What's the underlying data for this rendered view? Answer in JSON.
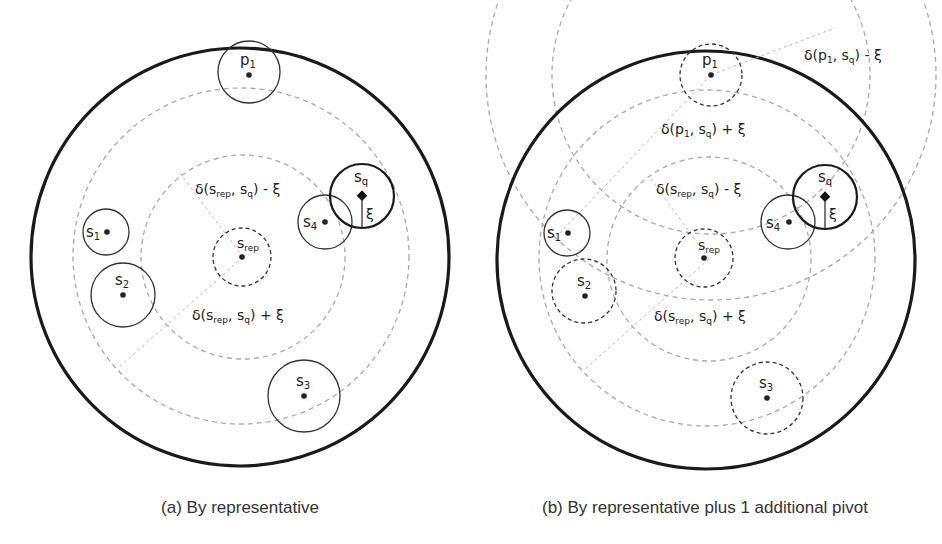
{
  "panels": [
    {
      "id": "a",
      "caption": "(a) By representative",
      "labels": {
        "p1": "p",
        "p1_sub": "1",
        "s1": "s",
        "s1_sub": "1",
        "s2": "s",
        "s2_sub": "2",
        "s3": "s",
        "s3_sub": "3",
        "s4": "s",
        "s4_sub": "4",
        "sq": "s",
        "sq_sub": "q",
        "srep": "s",
        "srep_sub": "rep",
        "xi": "ξ",
        "inner_bound": "δ(s",
        "inner_bound_sub": "rep",
        "inner_bound_rest": ", s",
        "inner_bound_sub2": "q",
        "inner_bound_tail": ") - ξ",
        "outer_bound": "δ(s",
        "outer_bound_sub": "rep",
        "outer_bound_rest": ", s",
        "outer_bound_sub2": "q",
        "outer_bound_tail": ") + ξ"
      }
    },
    {
      "id": "b",
      "caption": "(b) By representative plus 1 additional pivot",
      "labels": {
        "p1": "p",
        "p1_sub": "1",
        "s1": "s",
        "s1_sub": "1",
        "s2": "s",
        "s2_sub": "2",
        "s3": "s",
        "s3_sub": "3",
        "s4": "s",
        "s4_sub": "4",
        "sq": "s",
        "sq_sub": "q",
        "srep": "s",
        "srep_sub": "rep",
        "xi": "ξ",
        "pivot_minus": "δ(p",
        "pivot_minus_sub": "1",
        "pivot_minus_rest": ", s",
        "pivot_minus_sub2": "q",
        "pivot_minus_tail": ") - ξ",
        "pivot_plus": "δ(p",
        "pivot_plus_sub": "1",
        "pivot_plus_rest": ", s",
        "pivot_plus_sub2": "q",
        "pivot_plus_tail": ") + ξ",
        "inner_bound": "δ(s",
        "inner_bound_sub": "rep",
        "inner_bound_rest": ", s",
        "inner_bound_sub2": "q",
        "inner_bound_tail": ") - ξ",
        "outer_bound": "δ(s",
        "outer_bound_sub": "rep",
        "outer_bound_rest": ", s",
        "outer_bound_sub2": "q",
        "outer_bound_tail": ") + ξ"
      }
    }
  ],
  "colors": {
    "outline": "#1a1a1a",
    "dashed_guide": "#aaaaaa",
    "dashed_dark": "#333333"
  }
}
